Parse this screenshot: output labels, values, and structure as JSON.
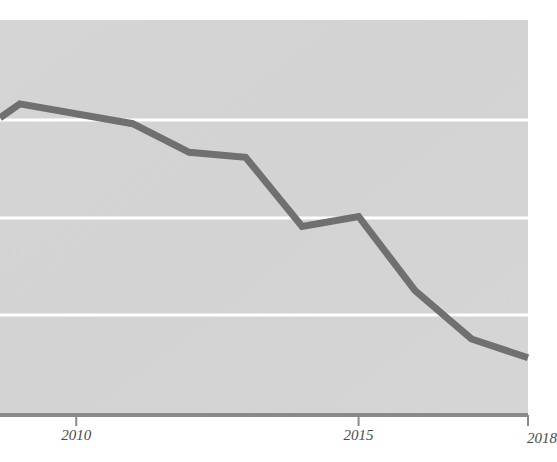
{
  "page": {
    "background_color": "#ffffff",
    "corner_artifact_text": "",
    "plot_background_color": "#d4d4d4",
    "gridline_color": "#ffffff",
    "axis_color": "#8a8a8a",
    "line_color": "#707070"
  },
  "chart_data": {
    "type": "line",
    "title": "",
    "subtitle": "",
    "xlabel": "",
    "ylabel": "",
    "grid": true,
    "gridlines_horizontal": 3,
    "legend": "none",
    "xlim": [
      2008.65,
      2018
    ],
    "ylim": [
      0,
      4
    ],
    "x_tick_labels": [
      "2010",
      "2015",
      "2018"
    ],
    "x_tick_values": [
      2010,
      2015,
      2018
    ],
    "y_tick_labels": [],
    "series": [
      {
        "name": "series-1",
        "x": [
          2008.65,
          2009,
          2011,
          2012,
          2013,
          2014,
          2015,
          2016,
          2017,
          2018
        ],
        "values": [
          3.01,
          3.15,
          2.95,
          2.66,
          2.61,
          1.91,
          2.01,
          1.26,
          0.77,
          0.58
        ],
        "color": "#707070"
      }
    ],
    "annotations": []
  }
}
